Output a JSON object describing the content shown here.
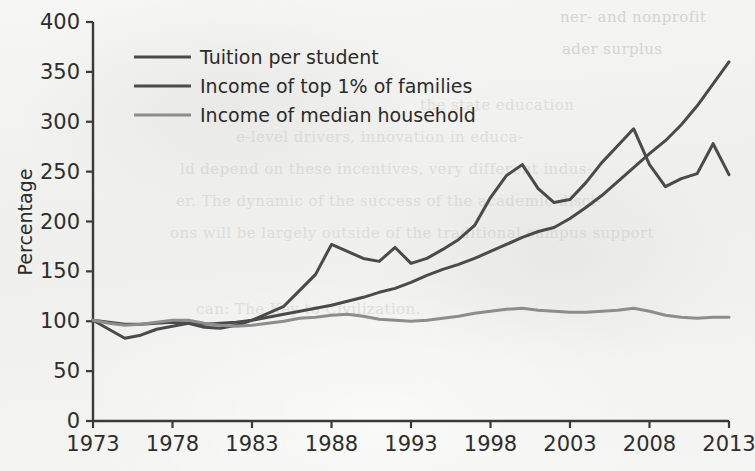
{
  "page": {
    "ghost_top_line": " ",
    "ghost_lines": [
      "ner- and nonprofit",
      "ader surplus",
      "the state education",
      "e-level drivers, innovation in educa-",
      "ld depend on these incentives, very different indus-",
      "er. The dynamic of the success of the academic disci-",
      "ons will be largely outside of the traditional campus support"
    ],
    "ghost_bottom": "can: The Key to Civilization."
  },
  "chart_data": {
    "type": "line",
    "title": "",
    "xlabel": "",
    "ylabel": "Percentage",
    "xlim": [
      1973,
      2013
    ],
    "ylim": [
      0,
      400
    ],
    "ytick_values": [
      0,
      50,
      100,
      150,
      200,
      250,
      300,
      350,
      400
    ],
    "ytick_labels": [
      "0",
      "50",
      "100",
      "150",
      "200",
      "250",
      "300",
      "350",
      "400"
    ],
    "xtick_values": [
      1973,
      1978,
      1983,
      1988,
      1993,
      1998,
      2003,
      2008,
      2013
    ],
    "xtick_labels": [
      "1973",
      "1978",
      "1983",
      "1988",
      "1993",
      "1998",
      "2003",
      "2008",
      "2013"
    ],
    "grid": false,
    "legend_position": "upper-left-inside",
    "x": [
      1973,
      1974,
      1975,
      1976,
      1977,
      1978,
      1979,
      1980,
      1981,
      1982,
      1983,
      1984,
      1985,
      1986,
      1987,
      1988,
      1989,
      1990,
      1991,
      1992,
      1993,
      1994,
      1995,
      1996,
      1997,
      1998,
      1999,
      2000,
      2001,
      2002,
      2003,
      2004,
      2005,
      2006,
      2007,
      2008,
      2009,
      2010,
      2011,
      2012,
      2013
    ],
    "series": [
      {
        "name": "Tuition per student",
        "color": "#4a4a4a",
        "width": 3.0,
        "values": [
          101,
          99,
          97,
          97,
          98,
          99,
          98,
          97,
          98,
          99,
          101,
          104,
          107,
          110,
          113,
          116,
          120,
          124,
          129,
          133,
          139,
          146,
          152,
          157,
          163,
          170,
          177,
          184,
          190,
          194,
          203,
          214,
          226,
          240,
          254,
          268,
          281,
          297,
          316,
          338,
          360
        ]
      },
      {
        "name": "Income of top 1% of families",
        "color": "#4a4a4a",
        "width": 3.0,
        "values": [
          101,
          92,
          83,
          86,
          92,
          95,
          98,
          94,
          93,
          96,
          101,
          108,
          115,
          131,
          147,
          177,
          170,
          163,
          160,
          174,
          158,
          163,
          172,
          182,
          196,
          224,
          246,
          257,
          233,
          219,
          222,
          239,
          259,
          276,
          293,
          257,
          235,
          243,
          248,
          278,
          247
        ]
      },
      {
        "name": "Income of median household",
        "color": "#8d8d8d",
        "width": 3.0,
        "values": [
          101,
          98,
          96,
          97,
          99,
          101,
          101,
          98,
          96,
          95,
          96,
          98,
          100,
          103,
          104,
          106,
          107,
          105,
          102,
          101,
          100,
          101,
          103,
          105,
          108,
          110,
          112,
          113,
          111,
          110,
          109,
          109,
          110,
          111,
          113,
          110,
          106,
          104,
          103,
          104,
          104
        ]
      }
    ]
  }
}
